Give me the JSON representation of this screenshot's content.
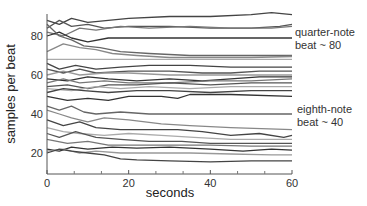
{
  "chart_data": {
    "type": "line",
    "title": "",
    "xlabel": "seconds",
    "ylabel": "samples per beat",
    "xlim": [
      0,
      60
    ],
    "ylim": [
      9,
      90
    ],
    "xticks": [
      0,
      20,
      40,
      60
    ],
    "xminor_ticks": [
      6.67,
      13.33,
      26.67,
      33.33,
      46.67,
      53.33
    ],
    "yticks": [
      20,
      40,
      60,
      80
    ],
    "grid": false,
    "legend": null,
    "annotations": [
      {
        "text_lines": [
          "quarter-note",
          "beat ~ 80"
        ],
        "y_anchor": 80
      },
      {
        "text_lines": [
          "eighth-note",
          "beat ~ 40"
        ],
        "y_anchor": 40
      }
    ],
    "series": [
      {
        "name": "s1",
        "color": "#444444",
        "points": [
          [
            0,
            88
          ],
          [
            3,
            86
          ],
          [
            6,
            89
          ],
          [
            10,
            87
          ],
          [
            15,
            88
          ],
          [
            20,
            89
          ],
          [
            30,
            90
          ],
          [
            40,
            90
          ],
          [
            50,
            91
          ],
          [
            55,
            92
          ],
          [
            60,
            91
          ]
        ]
      },
      {
        "name": "s2",
        "color": "#555555",
        "points": [
          [
            0,
            84
          ],
          [
            3,
            88
          ],
          [
            6,
            85
          ],
          [
            10,
            86
          ],
          [
            14,
            84
          ],
          [
            20,
            85
          ],
          [
            30,
            85
          ],
          [
            40,
            84
          ],
          [
            50,
            84
          ],
          [
            57,
            85
          ],
          [
            60,
            86
          ]
        ]
      },
      {
        "name": "s3",
        "color": "#777777",
        "points": [
          [
            0,
            82
          ],
          [
            4,
            80
          ],
          [
            8,
            84
          ],
          [
            12,
            83
          ],
          [
            18,
            85
          ],
          [
            25,
            84
          ],
          [
            35,
            85
          ],
          [
            45,
            84
          ],
          [
            55,
            84
          ],
          [
            60,
            85
          ]
        ]
      },
      {
        "name": "s4",
        "color": "#333333",
        "points": [
          [
            0,
            80
          ],
          [
            3,
            82
          ],
          [
            6,
            79
          ],
          [
            10,
            77
          ],
          [
            15,
            79
          ],
          [
            20,
            79
          ],
          [
            30,
            79
          ],
          [
            40,
            79
          ],
          [
            50,
            79
          ],
          [
            60,
            79
          ]
        ]
      },
      {
        "name": "s5",
        "color": "#666666",
        "points": [
          [
            0,
            86
          ],
          [
            3,
            80
          ],
          [
            6,
            78
          ],
          [
            9,
            75
          ],
          [
            13,
            74
          ],
          [
            18,
            72
          ],
          [
            25,
            71
          ],
          [
            35,
            70
          ],
          [
            45,
            70
          ],
          [
            60,
            70
          ]
        ]
      },
      {
        "name": "s6",
        "color": "#888888",
        "points": [
          [
            0,
            72
          ],
          [
            4,
            76
          ],
          [
            8,
            74
          ],
          [
            12,
            73
          ],
          [
            16,
            71
          ],
          [
            22,
            70
          ],
          [
            30,
            69
          ],
          [
            40,
            69
          ],
          [
            50,
            69
          ],
          [
            60,
            69.5
          ]
        ]
      },
      {
        "name": "s7",
        "color": "#aaaaaa",
        "points": [
          [
            0,
            68
          ],
          [
            5,
            68
          ],
          [
            10,
            68
          ],
          [
            20,
            68
          ],
          [
            30,
            68
          ],
          [
            40,
            68
          ],
          [
            50,
            68
          ],
          [
            60,
            68
          ]
        ]
      },
      {
        "name": "s8",
        "color": "#444444",
        "points": [
          [
            0,
            66
          ],
          [
            3,
            63
          ],
          [
            7,
            65
          ],
          [
            12,
            63
          ],
          [
            18,
            64
          ],
          [
            25,
            65
          ],
          [
            35,
            65
          ],
          [
            45,
            64
          ],
          [
            55,
            64
          ],
          [
            60,
            64
          ]
        ]
      },
      {
        "name": "s9",
        "color": "#555555",
        "points": [
          [
            0,
            63
          ],
          [
            4,
            61
          ],
          [
            8,
            63
          ],
          [
            12,
            61
          ],
          [
            20,
            62
          ],
          [
            30,
            62
          ],
          [
            38,
            61
          ],
          [
            45,
            61
          ],
          [
            52,
            62
          ],
          [
            60,
            62
          ]
        ]
      },
      {
        "name": "s10",
        "color": "#999999",
        "points": [
          [
            0,
            60
          ],
          [
            4,
            62
          ],
          [
            8,
            60
          ],
          [
            14,
            61
          ],
          [
            20,
            61
          ],
          [
            30,
            60
          ],
          [
            40,
            60
          ],
          [
            50,
            60
          ],
          [
            60,
            60
          ]
        ]
      },
      {
        "name": "s11",
        "color": "#333333",
        "points": [
          [
            0,
            58
          ],
          [
            5,
            57
          ],
          [
            10,
            59
          ],
          [
            15,
            58
          ],
          [
            22,
            57
          ],
          [
            30,
            58
          ],
          [
            38,
            57
          ],
          [
            45,
            58
          ],
          [
            52,
            59
          ],
          [
            60,
            59
          ]
        ]
      },
      {
        "name": "s12",
        "color": "#777777",
        "points": [
          [
            0,
            56
          ],
          [
            4,
            58
          ],
          [
            8,
            56
          ],
          [
            14,
            57
          ],
          [
            20,
            56
          ],
          [
            30,
            56
          ],
          [
            40,
            57
          ],
          [
            50,
            57
          ],
          [
            60,
            58
          ]
        ]
      },
      {
        "name": "s13",
        "color": "#555555",
        "points": [
          [
            0,
            54
          ],
          [
            5,
            55
          ],
          [
            10,
            53
          ],
          [
            15,
            55
          ],
          [
            22,
            55
          ],
          [
            30,
            56
          ],
          [
            40,
            55
          ],
          [
            50,
            56
          ],
          [
            60,
            56
          ]
        ]
      },
      {
        "name": "s14",
        "color": "#aaaaaa",
        "points": [
          [
            0,
            53
          ],
          [
            6,
            52
          ],
          [
            12,
            54
          ],
          [
            18,
            53
          ],
          [
            25,
            54
          ],
          [
            35,
            53
          ],
          [
            45,
            54
          ],
          [
            55,
            54
          ],
          [
            60,
            54
          ]
        ]
      },
      {
        "name": "s15",
        "color": "#444444",
        "points": [
          [
            0,
            51
          ],
          [
            4,
            53
          ],
          [
            9,
            52
          ],
          [
            15,
            51
          ],
          [
            22,
            52
          ],
          [
            30,
            52
          ],
          [
            40,
            51
          ],
          [
            50,
            52
          ],
          [
            60,
            52
          ]
        ]
      },
      {
        "name": "s16",
        "color": "#333333",
        "points": [
          [
            0,
            49
          ],
          [
            5,
            47
          ],
          [
            10,
            48
          ],
          [
            15,
            47
          ],
          [
            20,
            49
          ],
          [
            28,
            49
          ],
          [
            32,
            48
          ],
          [
            35,
            50
          ],
          [
            45,
            50
          ],
          [
            60,
            49
          ]
        ]
      },
      {
        "name": "s17",
        "color": "#666666",
        "points": [
          [
            0,
            44
          ],
          [
            3,
            42
          ],
          [
            6,
            44
          ],
          [
            9,
            41
          ],
          [
            12,
            40
          ],
          [
            18,
            41
          ],
          [
            25,
            40
          ],
          [
            35,
            40
          ],
          [
            45,
            40
          ],
          [
            60,
            40
          ]
        ]
      },
      {
        "name": "s18",
        "color": "#888888",
        "points": [
          [
            0,
            42
          ],
          [
            3,
            40
          ],
          [
            6,
            38
          ],
          [
            10,
            36
          ],
          [
            14,
            38
          ],
          [
            20,
            37
          ],
          [
            28,
            35
          ],
          [
            35,
            34
          ],
          [
            45,
            33
          ],
          [
            60,
            32
          ]
        ]
      },
      {
        "name": "s19",
        "color": "#444444",
        "points": [
          [
            0,
            37
          ],
          [
            4,
            34
          ],
          [
            8,
            36
          ],
          [
            12,
            33
          ],
          [
            18,
            32
          ],
          [
            25,
            32
          ],
          [
            32,
            32
          ],
          [
            38,
            31
          ],
          [
            45,
            29
          ],
          [
            52,
            30
          ],
          [
            58,
            28
          ],
          [
            60,
            29
          ]
        ]
      },
      {
        "name": "s20",
        "color": "#aaaaaa",
        "points": [
          [
            0,
            33
          ],
          [
            4,
            31
          ],
          [
            8,
            30
          ],
          [
            14,
            29
          ],
          [
            20,
            30
          ],
          [
            28,
            29
          ],
          [
            36,
            28
          ],
          [
            45,
            27
          ],
          [
            52,
            27
          ],
          [
            60,
            27
          ]
        ]
      },
      {
        "name": "s21",
        "color": "#555555",
        "points": [
          [
            0,
            30
          ],
          [
            3,
            28
          ],
          [
            7,
            31
          ],
          [
            12,
            28
          ],
          [
            18,
            27
          ],
          [
            25,
            26
          ],
          [
            33,
            26
          ],
          [
            40,
            25
          ],
          [
            50,
            25
          ],
          [
            60,
            25
          ]
        ]
      },
      {
        "name": "s22",
        "color": "#777777",
        "points": [
          [
            0,
            27
          ],
          [
            5,
            25
          ],
          [
            10,
            26
          ],
          [
            15,
            24
          ],
          [
            22,
            24
          ],
          [
            30,
            24
          ],
          [
            40,
            24
          ],
          [
            50,
            23.5
          ],
          [
            60,
            23.5
          ]
        ]
      },
      {
        "name": "s23",
        "color": "#333333",
        "points": [
          [
            0,
            22
          ],
          [
            3,
            21
          ],
          [
            6,
            23
          ],
          [
            10,
            22
          ],
          [
            16,
            23
          ],
          [
            22,
            22.5
          ],
          [
            30,
            23
          ],
          [
            40,
            22
          ],
          [
            48,
            21
          ],
          [
            55,
            22
          ],
          [
            60,
            21.5
          ]
        ]
      },
      {
        "name": "s24",
        "color": "#999999",
        "points": [
          [
            0,
            21
          ],
          [
            4,
            22
          ],
          [
            8,
            20
          ],
          [
            12,
            21
          ],
          [
            18,
            20
          ],
          [
            25,
            20
          ],
          [
            35,
            20
          ],
          [
            45,
            19.5
          ],
          [
            55,
            19
          ],
          [
            60,
            19
          ]
        ]
      },
      {
        "name": "s25",
        "color": "#444444",
        "points": [
          [
            0,
            20
          ],
          [
            3,
            22
          ],
          [
            6,
            21
          ],
          [
            10,
            20
          ],
          [
            14,
            19
          ],
          [
            18,
            17
          ],
          [
            22,
            16.5
          ],
          [
            30,
            16
          ],
          [
            40,
            15.5
          ],
          [
            50,
            16
          ],
          [
            60,
            16
          ]
        ]
      }
    ]
  }
}
